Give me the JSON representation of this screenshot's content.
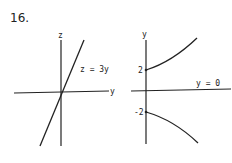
{
  "problem_number": "16.",
  "left_figure": {
    "vertical_axis_label": "z",
    "horizontal_axis_label": "y",
    "line_label": "z = 3y",
    "line_slope": 3
  },
  "right_figure": {
    "vertical_axis_label": "y",
    "asymptote_label": "y = 0",
    "upper_intercept_label": "2",
    "lower_intercept_label": "-2",
    "upper_intercept": 2,
    "lower_intercept": -2
  }
}
